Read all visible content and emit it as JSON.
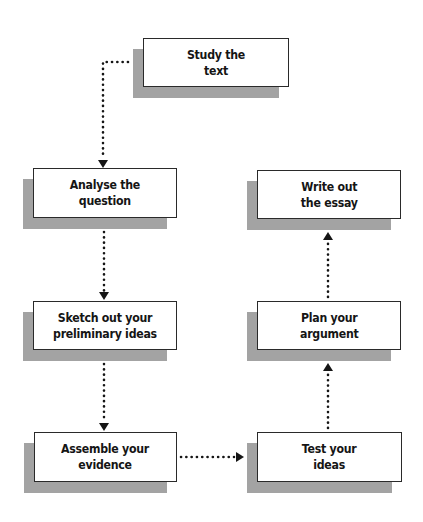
{
  "diagram": {
    "type": "flowchart",
    "colors": {
      "box_fill": "#ffffff",
      "box_border": "#2a2a2a",
      "shadow": "#a3a3a3",
      "text": "#151515",
      "connector": "#151515"
    },
    "nodes": [
      {
        "id": "study",
        "label": "Study the\ntext"
      },
      {
        "id": "analyse",
        "label": "Analyse the\nquestion"
      },
      {
        "id": "sketch",
        "label": "Sketch out your\npreliminary ideas"
      },
      {
        "id": "assemble",
        "label": "Assemble your\nevidence"
      },
      {
        "id": "test",
        "label": "Test your\nideas"
      },
      {
        "id": "plan",
        "label": "Plan your\nargument"
      },
      {
        "id": "write",
        "label": "Write out\nthe essay"
      }
    ],
    "edges": [
      {
        "from": "study",
        "to": "analyse",
        "style": "dotted",
        "arrow": "down"
      },
      {
        "from": "analyse",
        "to": "sketch",
        "style": "dotted",
        "arrow": "down"
      },
      {
        "from": "sketch",
        "to": "assemble",
        "style": "dotted",
        "arrow": "down"
      },
      {
        "from": "assemble",
        "to": "test",
        "style": "dotted",
        "arrow": "right"
      },
      {
        "from": "test",
        "to": "plan",
        "style": "dotted",
        "arrow": "up"
      },
      {
        "from": "plan",
        "to": "write",
        "style": "dotted",
        "arrow": "up"
      }
    ]
  }
}
